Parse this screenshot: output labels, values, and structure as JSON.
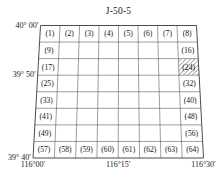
{
  "sheet": {
    "title": "J-50-5",
    "rows": 8,
    "cols": 8,
    "highlighted_cell": "(24)"
  },
  "axes": {
    "latitude_labels": [
      {
        "text": "40° 00′",
        "value": "40°00'"
      },
      {
        "text": "39° 50′",
        "value": "39°50'"
      },
      {
        "text": "39° 40′",
        "value": "39°40'"
      }
    ],
    "longitude_labels": [
      {
        "text": "116°00′",
        "value": "116°00'"
      },
      {
        "text": "116°15′",
        "value": "116°15'"
      },
      {
        "text": "116°30′",
        "value": "116°30'"
      }
    ]
  },
  "labelled_cells": [
    {
      "n": 1,
      "text": "(1)",
      "row": 0,
      "col": 0
    },
    {
      "n": 2,
      "text": "(2)",
      "row": 0,
      "col": 1
    },
    {
      "n": 3,
      "text": "(3)",
      "row": 0,
      "col": 2
    },
    {
      "n": 4,
      "text": "(4)",
      "row": 0,
      "col": 3
    },
    {
      "n": 5,
      "text": "(5)",
      "row": 0,
      "col": 4
    },
    {
      "n": 6,
      "text": "(6)",
      "row": 0,
      "col": 5
    },
    {
      "n": 7,
      "text": "(7)",
      "row": 0,
      "col": 6
    },
    {
      "n": 8,
      "text": "(8)",
      "row": 0,
      "col": 7
    },
    {
      "n": 9,
      "text": "(9)",
      "row": 1,
      "col": 0
    },
    {
      "n": 16,
      "text": "(16)",
      "row": 1,
      "col": 7
    },
    {
      "n": 17,
      "text": "(17)",
      "row": 2,
      "col": 0
    },
    {
      "n": 24,
      "text": "(24)",
      "row": 2,
      "col": 7
    },
    {
      "n": 25,
      "text": "(25)",
      "row": 3,
      "col": 0
    },
    {
      "n": 32,
      "text": "(32)",
      "row": 3,
      "col": 7
    },
    {
      "n": 33,
      "text": "(33)",
      "row": 4,
      "col": 0
    },
    {
      "n": 40,
      "text": "(40)",
      "row": 4,
      "col": 7
    },
    {
      "n": 41,
      "text": "(41)",
      "row": 5,
      "col": 0
    },
    {
      "n": 48,
      "text": "(48)",
      "row": 5,
      "col": 7
    },
    {
      "n": 49,
      "text": "(49)",
      "row": 6,
      "col": 0
    },
    {
      "n": 56,
      "text": "(56)",
      "row": 6,
      "col": 7
    },
    {
      "n": 57,
      "text": "(57)",
      "row": 7,
      "col": 0
    },
    {
      "n": 58,
      "text": "(58)",
      "row": 7,
      "col": 1
    },
    {
      "n": 59,
      "text": "(59)",
      "row": 7,
      "col": 2
    },
    {
      "n": 60,
      "text": "(60)",
      "row": 7,
      "col": 3
    },
    {
      "n": 61,
      "text": "(61)",
      "row": 7,
      "col": 4
    },
    {
      "n": 62,
      "text": "(62)",
      "row": 7,
      "col": 5
    },
    {
      "n": 63,
      "text": "(63)",
      "row": 7,
      "col": 6
    },
    {
      "n": 64,
      "text": "(64)",
      "row": 7,
      "col": 7
    }
  ],
  "geometry": {
    "top_left_x": 40.5,
    "top_right_x": 196.5,
    "top_y": 25.5,
    "bottom_left_x": 33.0,
    "bottom_right_x": 203.5,
    "bottom_y": 158.0
  },
  "colors": {
    "line": "#4d4d4d",
    "text": "#111111",
    "hatch": "#555555",
    "background": "#ffffff"
  }
}
